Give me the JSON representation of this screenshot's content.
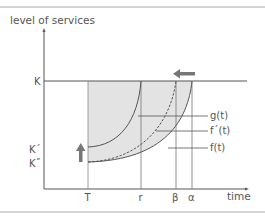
{
  "diagram": {
    "y_axis_label": "level of services",
    "x_axis_label": "time",
    "y_ticks": {
      "K": "K",
      "K_prime": "K´",
      "K_double_prime": "K˝"
    },
    "x_ticks": {
      "T": "T",
      "r": "r",
      "beta": "β",
      "alpha": "α"
    },
    "curves": {
      "g": "g(t)",
      "f_prime": "f´(t)",
      "f": "f(t)"
    },
    "arrows": {
      "shift_left": "arrow-left",
      "shift_up": "arrow-up"
    },
    "colors": {
      "shade": "#e3e3e3",
      "line": "#555555",
      "arrow": "#777777",
      "border": "#aaaaaa"
    }
  }
}
